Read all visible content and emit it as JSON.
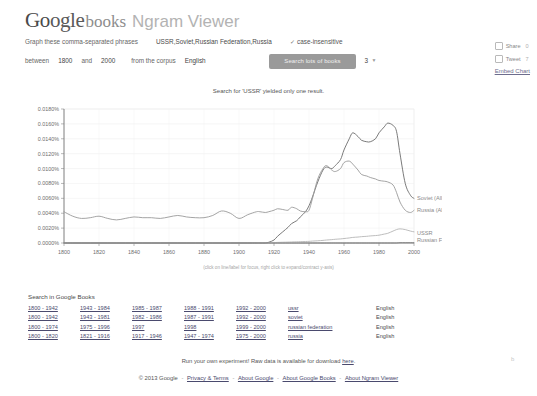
{
  "header": {
    "logo_google_part1": "Go",
    "logo_google_part2": "ogle",
    "logo_books": "books",
    "logo_ngram": "Ngram Viewer"
  },
  "query": {
    "phrases_label": "Graph these comma-separated phrases",
    "phrases_value": "USSR,Soviet,Russian Federation,Russia",
    "case_insensitive_label": "case-insensitive",
    "case_insensitive_check": "✓",
    "between_label": "between",
    "year_start": "1800",
    "and_label": "and",
    "year_end": "2000",
    "corpus_label": "from the corpus",
    "corpus_value": "English",
    "smoothing_label": "with smoothing of",
    "smoothing_value": "3",
    "caret": "▼",
    "search_button": "Search lots of books"
  },
  "social": {
    "share_label": "Share",
    "share_count": "0",
    "tweet_label": "Tweet",
    "tweet_count": "7",
    "embed_label": "Embed Chart"
  },
  "notice": "Search for 'USSR' yielded only one result.",
  "chart_hint": "(click on line/label for focus, right click to expand/contract y-axis)",
  "search_in_books": {
    "title": "Search in Google Books",
    "columns": [
      "range-1",
      "range-2",
      "range-3",
      "range-4",
      "range-5",
      "term",
      "language"
    ],
    "rows": [
      {
        "r1": "1800 - 1942",
        "r2": "1943 - 1984",
        "r3": "1985 - 1987",
        "r4": "1988 - 1991",
        "r5": "1992 - 2000",
        "term": "ussr",
        "lang": "English"
      },
      {
        "r1": "1800 - 1942",
        "r2": "1943 - 1981",
        "r3": "1982 - 1986",
        "r4": "1987 - 1991",
        "r5": "1992 - 2000",
        "term": "soviet",
        "lang": "English"
      },
      {
        "r1": "1800 - 1974",
        "r2": "1975 - 1996",
        "r3": "1997",
        "r4": "1998",
        "r5": "1999 - 2000",
        "term": "russian federation",
        "lang": "English"
      },
      {
        "r1": "1800 - 1820",
        "r2": "1821 - 1916",
        "r3": "1917 - 1946",
        "r4": "1947 - 1974",
        "r5": "1975 - 2000",
        "term": "russia",
        "lang": "English"
      }
    ]
  },
  "footer": {
    "run_experiment_prefix": "Run your own experiment! Raw data is available for download",
    "run_experiment_link": "here",
    "run_experiment_suffix": ".",
    "copyright": "© 2013 Google",
    "links": [
      "Privacy & Terms",
      "About Google",
      "About Google Books",
      "About Ngram Viewer"
    ],
    "separator": "-"
  },
  "chart_data": {
    "type": "line",
    "title": "",
    "xlabel": "",
    "ylabel": "",
    "xlim": [
      1800,
      2000
    ],
    "ylim": [
      0.0,
      0.018
    ],
    "grid": true,
    "legend_position": "right-inline",
    "x_ticks": [
      "1800",
      "1820",
      "1840",
      "1860",
      "1880",
      "1900",
      "1920",
      "1940",
      "1960",
      "1980",
      "2000"
    ],
    "y_ticks": [
      "0.0000%",
      "0.0020%",
      "0.0040%",
      "0.0060%",
      "0.0080%",
      "0.0100%",
      "0.0120%",
      "0.0140%",
      "0.0160%",
      "0.0180%"
    ],
    "x": [
      1800,
      1805,
      1810,
      1815,
      1820,
      1825,
      1830,
      1835,
      1840,
      1845,
      1850,
      1855,
      1860,
      1865,
      1870,
      1875,
      1880,
      1885,
      1890,
      1895,
      1900,
      1905,
      1910,
      1912,
      1915,
      1917,
      1920,
      1922,
      1925,
      1928,
      1930,
      1933,
      1935,
      1938,
      1940,
      1942,
      1945,
      1948,
      1950,
      1953,
      1955,
      1958,
      1960,
      1963,
      1965,
      1968,
      1970,
      1973,
      1975,
      1978,
      1980,
      1983,
      1985,
      1988,
      1990,
      1992,
      1995,
      1998,
      2000
    ],
    "series": [
      {
        "name": "Soviet (All)",
        "color": "#6b6b6b",
        "label": "Soviet (All)",
        "values": [
          0,
          0,
          0,
          0,
          0,
          0,
          0,
          0,
          0,
          0,
          0,
          0,
          0,
          0,
          0,
          0,
          0,
          0,
          0,
          0,
          0,
          0,
          0,
          0,
          0,
          0.0001,
          0.0004,
          0.0009,
          0.0015,
          0.0021,
          0.0026,
          0.003,
          0.0035,
          0.0042,
          0.005,
          0.0062,
          0.0082,
          0.0098,
          0.0102,
          0.01,
          0.0104,
          0.0112,
          0.0125,
          0.014,
          0.0148,
          0.0143,
          0.0138,
          0.0136,
          0.0136,
          0.014,
          0.0148,
          0.0156,
          0.0161,
          0.0158,
          0.015,
          0.012,
          0.008,
          0.0064,
          0.006
        ]
      },
      {
        "name": "Russia (All)",
        "color": "#9a9a9a",
        "label": "Russia (All)",
        "values": [
          0.0042,
          0.0036,
          0.0033,
          0.0034,
          0.0036,
          0.0033,
          0.0031,
          0.0033,
          0.0035,
          0.0034,
          0.0034,
          0.0033,
          0.0035,
          0.0037,
          0.0035,
          0.0034,
          0.0034,
          0.0037,
          0.0043,
          0.004,
          0.0033,
          0.0038,
          0.0042,
          0.0042,
          0.0041,
          0.0042,
          0.0044,
          0.0046,
          0.0045,
          0.0044,
          0.0048,
          0.0046,
          0.0043,
          0.0042,
          0.0044,
          0.006,
          0.0086,
          0.01,
          0.0104,
          0.0098,
          0.0096,
          0.01,
          0.0108,
          0.011,
          0.0106,
          0.0098,
          0.0092,
          0.009,
          0.0088,
          0.0086,
          0.0084,
          0.0083,
          0.0082,
          0.0078,
          0.0068,
          0.0055,
          0.0044,
          0.0041,
          0.0044
        ]
      },
      {
        "name": "Russian Federation (All)",
        "color": "#b5b5b5",
        "label": "Russian Federation (All)",
        "values": [
          0,
          0,
          0,
          0,
          0,
          0,
          0,
          0,
          0,
          0,
          0,
          0,
          0,
          0,
          0,
          0,
          0,
          0,
          0,
          0,
          0,
          0,
          0,
          0,
          0,
          0,
          5e-05,
          8e-05,
          0.0001,
          0.00012,
          0.00014,
          0.00016,
          0.00018,
          0.0002,
          0.00022,
          0.00026,
          0.0003,
          0.00035,
          0.0004,
          0.00045,
          0.0005,
          0.00055,
          0.0006,
          0.00068,
          0.00075,
          0.0008,
          0.00085,
          0.0009,
          0.00095,
          0.001,
          0.00105,
          0.0012,
          0.0013,
          0.0016,
          0.0018,
          0.0019,
          0.0018,
          0.0016,
          0.0015
        ]
      },
      {
        "name": "USSR",
        "color": "#808080",
        "label": "USSR",
        "values": [
          0,
          0,
          0,
          0,
          0,
          0,
          0,
          0,
          0,
          0,
          0,
          0,
          0,
          0,
          0,
          0,
          0,
          0,
          0,
          0,
          0,
          0,
          0,
          0,
          0,
          0,
          0,
          0,
          0,
          0,
          0,
          0,
          0,
          0,
          0,
          0,
          0,
          0,
          0,
          0,
          0,
          0,
          0,
          0,
          0,
          0,
          0,
          0,
          0,
          0,
          0,
          0,
          0,
          0,
          0,
          4e-05,
          4e-05,
          4e-05,
          4e-05
        ]
      }
    ],
    "series_labels_right": [
      "Soviet (All)",
      "Russia (All)",
      "USSR",
      "Russian Federation (All)"
    ]
  }
}
